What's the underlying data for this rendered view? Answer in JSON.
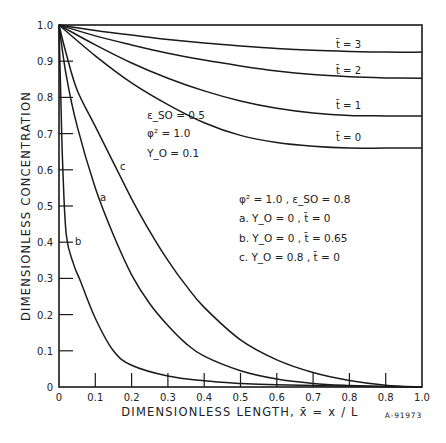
{
  "chart_data": {
    "type": "line",
    "title": "",
    "xlabel": "DIMENSIONLESS LENGTH, x̄ = x / L",
    "ylabel": "DIMENSIONLESS CONCENTRATION",
    "xlim": [
      0,
      1.0
    ],
    "ylim": [
      0,
      1.0
    ],
    "grid": false,
    "x_tick_labels": [
      "0",
      "0.1",
      "0.2",
      "0.3",
      "0.4",
      "0.5",
      "0.6",
      "0.7",
      "0.8",
      "0.8",
      "1.0"
    ],
    "y_tick_labels": [
      "0",
      "0.1",
      "0.2",
      "0.3",
      "0.4",
      "0.5",
      "0.6",
      "0.7",
      "0.8",
      "0.9",
      "1.0"
    ],
    "annotations": {
      "group1": [
        "ε_SO = 0.5",
        "φ² = 1.0",
        "Y_O = 0.1"
      ],
      "group2": [
        "φ² = 1.0 , ε_SO = 0.8",
        "a.  Y_O = 0 , t̄ = 0",
        "b.  Y_O = 0 , t̄ = 0.65",
        "c.  Y_O = 0.8 , t̄ = 0"
      ]
    },
    "figure_id": "A-91973",
    "series": [
      {
        "name": "t̄ = 3",
        "x": [
          0,
          0.1,
          0.2,
          0.3,
          0.4,
          0.5,
          0.6,
          0.7,
          0.8,
          0.9,
          1.0
        ],
        "y": [
          1.0,
          0.985,
          0.972,
          0.96,
          0.95,
          0.942,
          0.935,
          0.93,
          0.927,
          0.925,
          0.925
        ]
      },
      {
        "name": "t̄ = 2",
        "x": [
          0,
          0.1,
          0.2,
          0.3,
          0.4,
          0.5,
          0.6,
          0.7,
          0.8,
          0.9,
          1.0
        ],
        "y": [
          1.0,
          0.97,
          0.945,
          0.922,
          0.903,
          0.887,
          0.873,
          0.863,
          0.857,
          0.854,
          0.853
        ]
      },
      {
        "name": "t̄ = 1",
        "x": [
          0,
          0.1,
          0.2,
          0.3,
          0.4,
          0.5,
          0.6,
          0.7,
          0.8,
          0.9,
          1.0
        ],
        "y": [
          1.0,
          0.945,
          0.895,
          0.853,
          0.818,
          0.79,
          0.77,
          0.757,
          0.75,
          0.749,
          0.749
        ]
      },
      {
        "name": "t̄ = 0",
        "x": [
          0,
          0.1,
          0.2,
          0.3,
          0.4,
          0.5,
          0.6,
          0.7,
          0.8,
          0.9,
          1.0
        ],
        "y": [
          1.0,
          0.915,
          0.84,
          0.78,
          0.73,
          0.695,
          0.675,
          0.665,
          0.66,
          0.66,
          0.66
        ]
      },
      {
        "name": "a",
        "x": [
          0,
          0.02,
          0.05,
          0.1,
          0.15,
          0.2,
          0.25,
          0.3,
          0.35,
          0.4,
          0.5,
          0.6,
          0.7,
          0.8,
          0.9,
          1.0
        ],
        "y": [
          1.0,
          0.86,
          0.72,
          0.55,
          0.42,
          0.31,
          0.23,
          0.17,
          0.12,
          0.085,
          0.045,
          0.022,
          0.01,
          0.004,
          0.001,
          0.0
        ]
      },
      {
        "name": "b",
        "x": [
          0,
          0.005,
          0.01,
          0.02,
          0.04,
          0.06,
          0.1,
          0.15,
          0.2,
          0.3,
          0.4,
          0.5,
          0.6,
          0.8,
          1.0
        ],
        "y": [
          1.0,
          0.8,
          0.62,
          0.42,
          0.34,
          0.29,
          0.19,
          0.1,
          0.06,
          0.03,
          0.017,
          0.01,
          0.006,
          0.002,
          0.0
        ]
      },
      {
        "name": "c",
        "x": [
          0,
          0.02,
          0.05,
          0.1,
          0.15,
          0.2,
          0.25,
          0.3,
          0.35,
          0.4,
          0.5,
          0.6,
          0.7,
          0.8,
          0.9,
          1.0
        ],
        "y": [
          1.0,
          0.92,
          0.82,
          0.72,
          0.62,
          0.52,
          0.43,
          0.35,
          0.28,
          0.22,
          0.13,
          0.075,
          0.04,
          0.018,
          0.005,
          0.0
        ]
      }
    ]
  },
  "labels": {
    "t3": "t̄ = 3",
    "t2": "t̄ = 2",
    "t1": "t̄ = 1",
    "t0": "t̄ = 0",
    "a": "a",
    "b": "b",
    "c": "c"
  }
}
